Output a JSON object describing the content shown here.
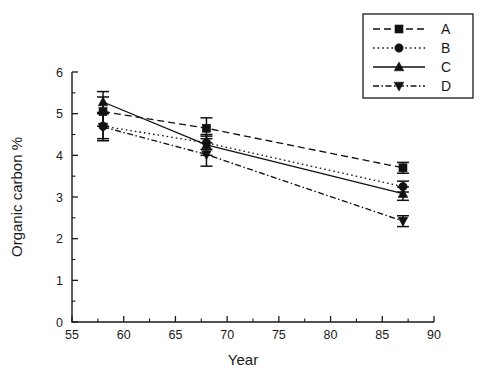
{
  "chart_data": {
    "type": "line",
    "title": "",
    "subtitle": "",
    "xlabel": "Year",
    "ylabel": "Organic carbon %",
    "xlim": [
      55,
      90
    ],
    "ylim": [
      0,
      6
    ],
    "x_ticks": [
      55,
      60,
      65,
      70,
      75,
      80,
      85,
      90
    ],
    "x_tick_labels": [
      "55",
      "60",
      "65",
      "70",
      "75",
      "80",
      "85",
      "90"
    ],
    "x_minor_step": 2.5,
    "y_ticks": [
      0,
      1,
      2,
      3,
      4,
      5,
      6
    ],
    "y_tick_labels": [
      "0",
      "1",
      "2",
      "3",
      "4",
      "5",
      "6"
    ],
    "y_minor_step": 0.5,
    "grid": false,
    "legend_position": "top-right",
    "x": [
      58,
      68,
      87
    ],
    "series": [
      {
        "name": "A",
        "marker": "square",
        "linestyle": "dashed",
        "color": "#111111",
        "values": [
          5.05,
          4.65,
          3.7
        ],
        "errors": [
          0.35,
          0.25,
          0.13
        ]
      },
      {
        "name": "B",
        "marker": "circle",
        "linestyle": "dotted",
        "color": "#111111",
        "values": [
          4.7,
          4.3,
          3.25
        ],
        "errors": [
          0.3,
          0.16,
          0.13
        ]
      },
      {
        "name": "C",
        "marker": "triangle-up",
        "linestyle": "solid",
        "color": "#111111",
        "values": [
          5.28,
          4.25,
          3.08
        ],
        "errors": [
          0.25,
          0.25,
          0.16
        ]
      },
      {
        "name": "D",
        "marker": "triangle-down",
        "linestyle": "dashdot",
        "color": "#111111",
        "values": [
          4.68,
          4.02,
          2.42
        ],
        "errors": [
          0.33,
          0.28,
          0.13
        ]
      }
    ],
    "legend_entries": [
      {
        "label": "A",
        "marker": "square",
        "linestyle": "dashed"
      },
      {
        "label": "B",
        "marker": "circle",
        "linestyle": "dotted"
      },
      {
        "label": "C",
        "marker": "triangle-up",
        "linestyle": "solid"
      },
      {
        "label": "D",
        "marker": "triangle-down",
        "linestyle": "dashdot"
      }
    ]
  }
}
